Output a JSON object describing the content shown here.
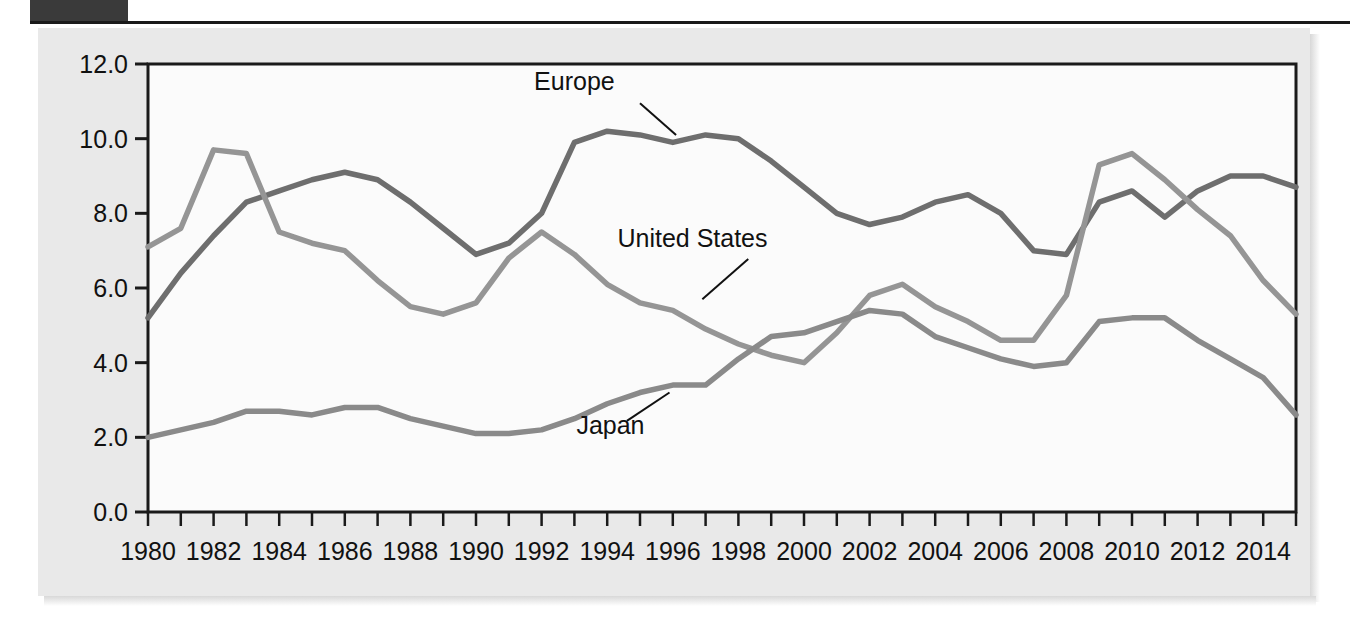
{
  "figure": {
    "background_color": "#e9e9e9",
    "plot_background_color": "#fbfbfb",
    "frame_color": "#1a1a1a"
  },
  "chart_data": {
    "type": "line",
    "title": "",
    "xlabel": "",
    "ylabel": "Unemployment rate (percent)",
    "xlim": [
      1980,
      2015
    ],
    "ylim": [
      0.0,
      12.0
    ],
    "grid": false,
    "legend_position": "inline-callout",
    "y_ticks": [
      "0.0",
      "2.0",
      "4.0",
      "6.0",
      "8.0",
      "10.0",
      "12.0"
    ],
    "y_tick_values": [
      0.0,
      2.0,
      4.0,
      6.0,
      8.0,
      10.0,
      12.0
    ],
    "x_tick_labels": [
      "1980",
      "1982",
      "1984",
      "1986",
      "1988",
      "1990",
      "1992",
      "1994",
      "1996",
      "1998",
      "2000",
      "2002",
      "2004",
      "2006",
      "2008",
      "2010",
      "2012",
      "2014"
    ],
    "x_tick_values": [
      1980,
      1982,
      1984,
      1986,
      1988,
      1990,
      1992,
      1994,
      1996,
      1998,
      2000,
      2002,
      2004,
      2006,
      2008,
      2010,
      2012,
      2014
    ],
    "x_minor_ticks": [
      1980,
      1981,
      1982,
      1983,
      1984,
      1985,
      1986,
      1987,
      1988,
      1989,
      1990,
      1991,
      1992,
      1993,
      1994,
      1995,
      1996,
      1997,
      1998,
      1999,
      2000,
      2001,
      2002,
      2003,
      2004,
      2005,
      2006,
      2007,
      2008,
      2009,
      2010,
      2011,
      2012,
      2013,
      2014,
      2015
    ],
    "x": [
      1980,
      1981,
      1982,
      1983,
      1984,
      1985,
      1986,
      1987,
      1988,
      1989,
      1990,
      1991,
      1992,
      1993,
      1994,
      1995,
      1996,
      1997,
      1998,
      1999,
      2000,
      2001,
      2002,
      2003,
      2004,
      2005,
      2006,
      2007,
      2008,
      2009,
      2010,
      2011,
      2012,
      2013,
      2014,
      2015
    ],
    "series": [
      {
        "name": "Europe",
        "color": "#6e6e6e",
        "label_x": 1993.0,
        "label_y": 11.3,
        "values": [
          5.2,
          6.4,
          7.4,
          8.3,
          8.6,
          8.9,
          9.1,
          8.9,
          8.3,
          7.6,
          6.9,
          7.2,
          8.0,
          9.9,
          10.2,
          10.1,
          9.9,
          10.1,
          10.0,
          9.4,
          8.7,
          8.0,
          7.7,
          7.9,
          8.3,
          8.5,
          8.0,
          7.0,
          6.9,
          8.3,
          8.6,
          7.9,
          8.6,
          9.0,
          9.0,
          8.7
        ]
      },
      {
        "name": "United States",
        "color": "#959595",
        "label_x": 1996.6,
        "label_y": 7.1,
        "values": [
          7.1,
          7.6,
          9.7,
          9.6,
          7.5,
          7.2,
          7.0,
          6.2,
          5.5,
          5.3,
          5.6,
          6.8,
          7.5,
          6.9,
          6.1,
          5.6,
          5.4,
          4.9,
          4.5,
          4.2,
          4.0,
          4.8,
          5.8,
          6.1,
          5.5,
          5.1,
          4.6,
          4.6,
          5.8,
          9.3,
          9.6,
          8.9,
          8.1,
          7.4,
          6.2,
          5.3
        ]
      },
      {
        "name": "Japan",
        "color": "#8a8a8a",
        "label_x": 1994.1,
        "label_y": 2.1,
        "values": [
          2.0,
          2.2,
          2.4,
          2.7,
          2.7,
          2.6,
          2.8,
          2.8,
          2.5,
          2.3,
          2.1,
          2.1,
          2.2,
          2.5,
          2.9,
          3.2,
          3.4,
          3.4,
          4.1,
          4.7,
          4.8,
          5.1,
          5.4,
          5.3,
          4.7,
          4.4,
          4.1,
          3.9,
          4.0,
          5.1,
          5.2,
          5.2,
          4.6,
          4.1,
          3.6,
          2.6
        ]
      }
    ],
    "callouts": [
      {
        "name": "Europe",
        "from": [
          1995.0,
          10.95
        ],
        "to": [
          1996.1,
          10.1
        ]
      },
      {
        "name": "United States",
        "from": [
          1998.3,
          6.78
        ],
        "to": [
          1996.9,
          5.7
        ]
      },
      {
        "name": "Japan",
        "from": [
          1994.6,
          2.44
        ],
        "to": [
          1995.9,
          3.2
        ]
      }
    ]
  }
}
